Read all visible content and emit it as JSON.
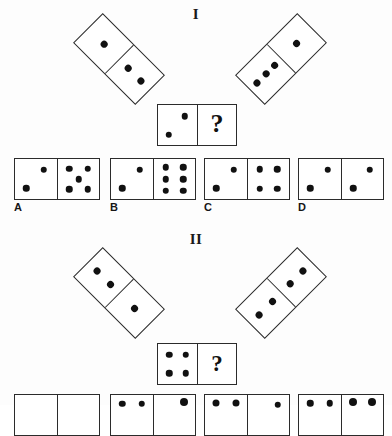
{
  "page": {
    "background_color": "#fdfdfd",
    "ink_color": "#111111"
  },
  "sections": [
    {
      "label": "I",
      "prompt_dominoes": [
        {
          "name": "left-tilted-domino",
          "rotation_deg": 45,
          "pips": [
            1,
            2
          ]
        },
        {
          "name": "right-tilted-domino",
          "rotation_deg": -45,
          "pips": [
            3,
            1
          ]
        }
      ],
      "question_domino": {
        "left_pips": 2,
        "right_pips": "?",
        "question_mark": "?"
      },
      "options": [
        {
          "letter": "A",
          "left_pips": 2,
          "right_pips": 5
        },
        {
          "letter": "B",
          "left_pips": 2,
          "right_pips": 6
        },
        {
          "letter": "C",
          "left_pips": 2,
          "right_pips": 4
        },
        {
          "letter": "D",
          "left_pips": 2,
          "right_pips": 2
        }
      ]
    },
    {
      "label": "II",
      "prompt_dominoes": [
        {
          "name": "left-tilted-domino",
          "rotation_deg": 45,
          "pips": [
            2,
            1
          ]
        },
        {
          "name": "right-tilted-domino",
          "rotation_deg": -45,
          "pips": [
            2,
            2
          ]
        }
      ],
      "question_domino": {
        "left_pips": 4,
        "right_pips": "?",
        "question_mark": "?"
      },
      "options": [
        {
          "letter": "",
          "left_pips": 0,
          "right_pips": 0
        },
        {
          "letter": "",
          "left_pips": 2,
          "right_pips": 1
        },
        {
          "letter": "",
          "left_pips": 2,
          "right_pips": 1
        },
        {
          "letter": "",
          "left_pips": 2,
          "right_pips": 2
        }
      ]
    }
  ]
}
